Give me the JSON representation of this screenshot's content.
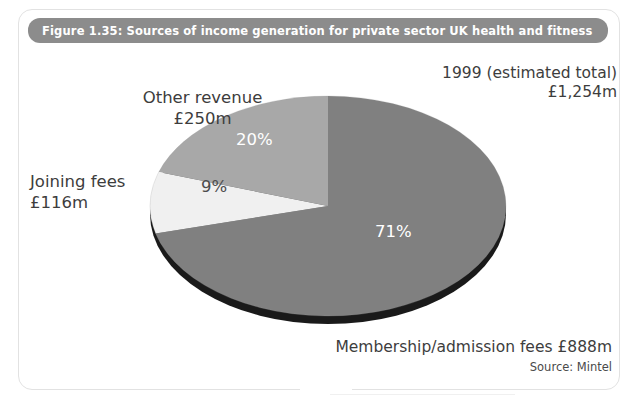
{
  "figure": {
    "title": "Figure 1.35: Sources of income generation for private sector UK health and fitness",
    "title_bar_color": "#8c8c8c",
    "frame_color": "#e2e2e2",
    "background": "#ffffff"
  },
  "annotations": {
    "total_line1": "1999 (estimated total)",
    "total_line2": "£1,254m",
    "other_line1": "Other revenue",
    "other_line2": "£250m",
    "joining_line1": "Joining fees",
    "joining_line2": "£116m",
    "membership": "Membership/admission fees £888m",
    "source": "Source: Mintel"
  },
  "chart_data": {
    "type": "pie",
    "title": "Figure 1.35: Sources of income generation for private sector UK health and fitness",
    "subtitle": "1999 (estimated total) £1,254m",
    "source": "Source: Mintel",
    "unit": "£m",
    "total": 1254,
    "total_label": "£1,254m",
    "legend": "none (direct labels)",
    "grid": false,
    "labels": [
      "Membership/admission fees",
      "Other revenue",
      "Joining fees"
    ],
    "values": [
      888,
      250,
      116
    ],
    "value_labels": [
      "£888m",
      "£250m",
      "£116m"
    ],
    "percentages": [
      71,
      20,
      9
    ],
    "percent_labels": [
      "71%",
      "20%",
      "9%"
    ],
    "colors": [
      "#808080",
      "#a8a8a8",
      "#f0f0f0"
    ],
    "depth_color": "#1a1a1a",
    "start_angle_deg": 0,
    "direction": "clockwise",
    "style": "3d-ellipse",
    "slices": [
      {
        "name": "Membership/admission fees",
        "value": 888,
        "value_label": "£888m",
        "percent": 71,
        "percent_label": "71%",
        "color": "#808080"
      },
      {
        "name": "Other revenue",
        "value": 250,
        "value_label": "£250m",
        "percent": 20,
        "percent_label": "20%",
        "color": "#a8a8a8"
      },
      {
        "name": "Joining fees",
        "value": 116,
        "value_label": "£116m",
        "percent": 9,
        "percent_label": "9%",
        "color": "#f0f0f0"
      }
    ]
  }
}
